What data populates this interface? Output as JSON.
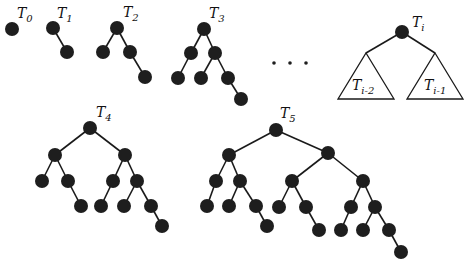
{
  "diagram": {
    "node_radius": 7,
    "node_color": "#1e1e1e",
    "edge_color": "#1a1a1a",
    "ellipsis": "• • •",
    "trees": [
      {
        "id": "T0",
        "label": "T",
        "subscript": "0",
        "label_pos": [
          17,
          18
        ],
        "nodes": [
          [
            12,
            29
          ]
        ],
        "edges": []
      },
      {
        "id": "T1",
        "label": "T",
        "subscript": "1",
        "label_pos": [
          57,
          18
        ],
        "nodes": [
          [
            53,
            28
          ],
          [
            67,
            52
          ]
        ],
        "edges": [
          [
            0,
            1
          ]
        ]
      },
      {
        "id": "T2",
        "label": "T",
        "subscript": "2",
        "label_pos": [
          123,
          17
        ],
        "nodes": [
          [
            117,
            28
          ],
          [
            103,
            52
          ],
          [
            130,
            52
          ],
          [
            145,
            77
          ]
        ],
        "edges": [
          [
            0,
            1
          ],
          [
            0,
            2
          ],
          [
            2,
            3
          ]
        ]
      },
      {
        "id": "T3",
        "label": "T",
        "subscript": "3",
        "label_pos": [
          209,
          18
        ],
        "nodes": [
          [
            204,
            29
          ],
          [
            191,
            53
          ],
          [
            215,
            53
          ],
          [
            178,
            78
          ],
          [
            201,
            78
          ],
          [
            228,
            78
          ],
          [
            241,
            99
          ]
        ],
        "edges": [
          [
            0,
            1
          ],
          [
            0,
            2
          ],
          [
            1,
            3
          ],
          [
            2,
            4
          ],
          [
            2,
            5
          ],
          [
            5,
            6
          ]
        ]
      },
      {
        "id": "T4",
        "label": "T",
        "subscript": "4",
        "label_pos": [
          96,
          117
        ],
        "nodes": [
          [
            90,
            128
          ],
          [
            55,
            155
          ],
          [
            125,
            155
          ],
          [
            42,
            181
          ],
          [
            68,
            181
          ],
          [
            81,
            206
          ],
          [
            113,
            181
          ],
          [
            137,
            181
          ],
          [
            101,
            206
          ],
          [
            124,
            206
          ],
          [
            151,
            206
          ],
          [
            162,
            226
          ]
        ],
        "edges": [
          [
            0,
            1
          ],
          [
            0,
            2
          ],
          [
            1,
            3
          ],
          [
            1,
            4
          ],
          [
            4,
            5
          ],
          [
            2,
            6
          ],
          [
            2,
            7
          ],
          [
            6,
            8
          ],
          [
            7,
            9
          ],
          [
            7,
            10
          ],
          [
            10,
            11
          ]
        ]
      },
      {
        "id": "T5",
        "label": "T",
        "subscript": "5",
        "label_pos": [
          280,
          118
        ],
        "nodes": [
          [
            276,
            130
          ],
          [
            229,
            155
          ],
          [
            328,
            153
          ],
          [
            216,
            181
          ],
          [
            240,
            181
          ],
          [
            207,
            206
          ],
          [
            229,
            206
          ],
          [
            256,
            206
          ],
          [
            267,
            226
          ],
          [
            292,
            181
          ],
          [
            363,
            181
          ],
          [
            279,
            207
          ],
          [
            306,
            207
          ],
          [
            319,
            230
          ],
          [
            351,
            207
          ],
          [
            375,
            207
          ],
          [
            341,
            230
          ],
          [
            363,
            230
          ],
          [
            389,
            230
          ],
          [
            401,
            252
          ]
        ],
        "edges": [
          [
            0,
            1
          ],
          [
            0,
            2
          ],
          [
            1,
            3
          ],
          [
            1,
            4
          ],
          [
            3,
            5
          ],
          [
            4,
            6
          ],
          [
            4,
            7
          ],
          [
            7,
            8
          ],
          [
            2,
            9
          ],
          [
            2,
            10
          ],
          [
            9,
            11
          ],
          [
            9,
            12
          ],
          [
            12,
            13
          ],
          [
            10,
            14
          ],
          [
            10,
            15
          ],
          [
            14,
            16
          ],
          [
            15,
            17
          ],
          [
            15,
            18
          ],
          [
            18,
            19
          ]
        ]
      }
    ],
    "recursive": {
      "id": "Ti",
      "label": "T",
      "subscript": "i",
      "label_pos": [
        412,
        27
      ],
      "root": [
        402,
        32
      ],
      "left_subtree": {
        "label": "T",
        "subscript": "i-2",
        "apex": [
          366,
          53
        ],
        "base_left": [
          338,
          99
        ],
        "base_right": [
          394,
          99
        ],
        "label_pos": [
          352,
          90
        ]
      },
      "right_subtree": {
        "label": "T",
        "subscript": "i-1",
        "apex": [
          435,
          53
        ],
        "base_left": [
          407,
          99
        ],
        "base_right": [
          463,
          99
        ],
        "label_pos": [
          424,
          90
        ]
      }
    }
  }
}
